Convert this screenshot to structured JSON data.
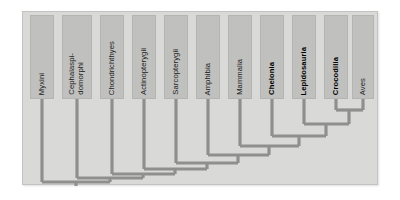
{
  "figure": {
    "kind": "phylogenetic-cladogram",
    "panel_background": "#d9d9d7",
    "label_box_color": "#c0c0be",
    "branch_color": "#8f8f8d"
  },
  "taxa": [
    {
      "id": "myxini",
      "label": "Myxini",
      "bold": false,
      "box_x": 7,
      "box_y": 3,
      "box_w": 24,
      "box_h": 84,
      "stem_x": 19,
      "tip_y": 87
    },
    {
      "id": "cephalaspidomorphi",
      "label": "Cephalaspi-\ndomorphi",
      "bold": false,
      "box_x": 39,
      "box_y": 3,
      "box_w": 30,
      "box_h": 84,
      "stem_x": 54,
      "tip_y": 87
    },
    {
      "id": "chondrichthyes",
      "label": "Chondrichthyes",
      "bold": false,
      "box_x": 77,
      "box_y": 3,
      "box_w": 24,
      "box_h": 84,
      "stem_x": 89,
      "tip_y": 87
    },
    {
      "id": "actinopterygii",
      "label": "Actinopterygii",
      "bold": false,
      "box_x": 109,
      "box_y": 3,
      "box_w": 24,
      "box_h": 84,
      "stem_x": 121,
      "tip_y": 87
    },
    {
      "id": "sarcopterygii",
      "label": "Sarcopterygii",
      "bold": false,
      "box_x": 141,
      "box_y": 3,
      "box_w": 24,
      "box_h": 84,
      "stem_x": 153,
      "tip_y": 87
    },
    {
      "id": "amphibia",
      "label": "Amphibia",
      "bold": false,
      "box_x": 173,
      "box_y": 3,
      "box_w": 24,
      "box_h": 84,
      "stem_x": 185,
      "tip_y": 87
    },
    {
      "id": "mammalia",
      "label": "Mammalia",
      "bold": false,
      "box_x": 205,
      "box_y": 3,
      "box_w": 24,
      "box_h": 84,
      "stem_x": 217,
      "tip_y": 87
    },
    {
      "id": "chelonia",
      "label": "Chelonia",
      "bold": true,
      "box_x": 237,
      "box_y": 3,
      "box_w": 24,
      "box_h": 84,
      "stem_x": 249,
      "tip_y": 87
    },
    {
      "id": "lepidosauria",
      "label": "Lepidosauria",
      "bold": true,
      "box_x": 269,
      "box_y": 3,
      "box_w": 24,
      "box_h": 84,
      "stem_x": 281,
      "tip_y": 87
    },
    {
      "id": "crocodilia",
      "label": "Crocodilia",
      "bold": true,
      "box_x": 301,
      "box_y": 3,
      "box_w": 24,
      "box_h": 84,
      "stem_x": 313,
      "tip_y": 87
    },
    {
      "id": "aves",
      "label": "Aves",
      "bold": false,
      "box_x": 329,
      "box_y": 3,
      "box_w": 22,
      "box_h": 84,
      "stem_x": 340,
      "tip_y": 87
    }
  ],
  "nodes": [
    {
      "id": "n-archosauria",
      "label": "Crocodilia + Aves",
      "y": 98,
      "left_x": 313,
      "right_x": 340,
      "parent_x": 326
    },
    {
      "id": "n-diapsida",
      "label": "Lepidosauria + clade",
      "y": 112,
      "left_x": 281,
      "right_x": 326,
      "parent_x": 303
    },
    {
      "id": "n-reptilia",
      "label": "Chelonia + clade",
      "y": 124,
      "left_x": 249,
      "right_x": 303,
      "parent_x": 276
    },
    {
      "id": "n-amniota",
      "label": "Mammalia + clade",
      "y": 134,
      "left_x": 217,
      "right_x": 276,
      "parent_x": 246
    },
    {
      "id": "n-tetrapoda",
      "label": "Amphibia + clade",
      "y": 143,
      "left_x": 185,
      "right_x": 246,
      "parent_x": 215
    },
    {
      "id": "n-sarcoptclade",
      "label": "Sarcopterygii + clade",
      "y": 151,
      "left_x": 153,
      "right_x": 215,
      "parent_x": 184
    },
    {
      "id": "n-osteichthyes",
      "label": "Actinopterygii + clade",
      "y": 157,
      "left_x": 121,
      "right_x": 184,
      "parent_x": 152
    },
    {
      "id": "n-gnathostomata",
      "label": "Chondrichthyes + clade",
      "y": 162,
      "left_x": 89,
      "right_x": 152,
      "parent_x": 120
    },
    {
      "id": "n-vertebrata",
      "label": "Cephalaspidomorphi + clade",
      "y": 166,
      "left_x": 54,
      "right_x": 120,
      "parent_x": 87
    },
    {
      "id": "n-root",
      "label": "Root",
      "y": 170,
      "left_x": 19,
      "right_x": 87,
      "parent_x": 53
    }
  ],
  "root_stub": {
    "x": 53,
    "y_top": 170,
    "y_bottom": 174
  }
}
